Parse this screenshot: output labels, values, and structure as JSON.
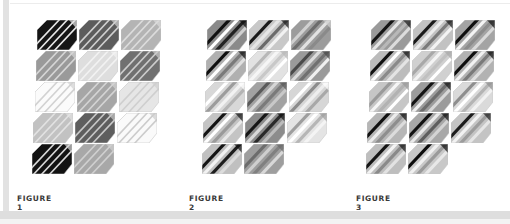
{
  "figures": [
    {
      "label": "FIGURE 1",
      "tiles": [
        {
          "bg": "#151515",
          "stripes": [
            "#e8e8e8",
            "#e8e8e8",
            "#e8e8e8",
            "#e8e8e8"
          ]
        },
        {
          "bg": "#5c5c5c",
          "stripes": [
            "#d0d0d0",
            "#d0d0d0",
            "#d0d0d0",
            "#d0d0d0"
          ]
        },
        {
          "bg": "#b4b4b4",
          "stripes": [
            "#dcdcdc",
            "#dcdcdc",
            "#dcdcdc",
            "#dcdcdc"
          ]
        },
        {
          "bg": "#9a9a9a",
          "stripes": [
            "#d6d6d6",
            "#d6d6d6",
            "#d6d6d6",
            "#d6d6d6"
          ]
        },
        {
          "bg": "#dedede",
          "stripes": [
            "#f2f2f2",
            "#f2f2f2",
            "#f2f2f2",
            "#f2f2f2"
          ]
        },
        {
          "bg": "#707070",
          "stripes": [
            "#cccccc",
            "#cccccc",
            "#cccccc",
            "#cccccc"
          ]
        },
        {
          "bg": "#fbfbfb",
          "stripes": [
            "#d2d2d2",
            "#d2d2d2",
            "#d2d2d2",
            "#d2d2d2"
          ]
        },
        {
          "bg": "#a6a6a6",
          "stripes": [
            "#d4d4d4",
            "#d4d4d4",
            "#d4d4d4",
            "#d4d4d4"
          ]
        },
        {
          "bg": "#e6e6e6",
          "stripes": [
            "#cfcfcf",
            "#cfcfcf",
            "#cfcfcf",
            "#cfcfcf"
          ]
        },
        {
          "bg": "#c2c2c2",
          "stripes": [
            "#e2e2e2",
            "#e2e2e2",
            "#e2e2e2",
            "#e2e2e2"
          ]
        },
        {
          "bg": "#5e5e5e",
          "stripes": [
            "#c8c8c8",
            "#c8c8c8",
            "#c8c8c8",
            "#c8c8c8"
          ]
        },
        {
          "bg": "#fafafa",
          "stripes": [
            "#cccccc",
            "#cccccc",
            "#cccccc",
            "#cccccc"
          ]
        },
        {
          "bg": "#121212",
          "stripes": [
            "#d8d8d8",
            "#d8d8d8",
            "#d8d8d8",
            "#d8d8d8"
          ]
        },
        {
          "bg": "#a8a8a8",
          "stripes": [
            "#d0d0d0",
            "#d0d0d0",
            "#d0d0d0",
            "#d0d0d0"
          ]
        }
      ]
    },
    {
      "label": "FIGURE 2",
      "tiles": [
        {
          "bg": "#8a8a8a",
          "stripes": [
            "#111111",
            "#ffffff",
            "#222222",
            "#d0d0d0"
          ]
        },
        {
          "bg": "#c8c8c8",
          "stripes": [
            "#1a1a1a",
            "#e6e6e6",
            "#6a6a6a",
            "#f2f2f2"
          ]
        },
        {
          "bg": "#9c9c9c",
          "stripes": [
            "#d0d0d0",
            "#6c6c6c",
            "#e2e2e2",
            "#8a8a8a"
          ]
        },
        {
          "bg": "#b0b0b0",
          "stripes": [
            "#0f0f0f",
            "#ffffff",
            "#7a7a7a",
            "#e0e0e0"
          ]
        },
        {
          "bg": "#e2e2e2",
          "stripes": [
            "#b8b8b8",
            "#f6f6f6",
            "#c8c8c8",
            "#ffffff"
          ]
        },
        {
          "bg": "#9a9a9a",
          "stripes": [
            "#4a4a4a",
            "#dcdcdc",
            "#707070",
            "#f0f0f0"
          ]
        },
        {
          "bg": "#d8d8d8",
          "stripes": [
            "#ffffff",
            "#9c9c9c",
            "#f2f2f2",
            "#b4b4b4"
          ]
        },
        {
          "bg": "#a2a2a2",
          "stripes": [
            "#5a5a5a",
            "#d6d6d6",
            "#7a7a7a",
            "#c8c8c8"
          ]
        },
        {
          "bg": "#d6d6d6",
          "stripes": [
            "#ffffff",
            "#8c8c8c",
            "#eeeeee",
            "#a8a8a8"
          ]
        },
        {
          "bg": "#c4c4c4",
          "stripes": [
            "#141414",
            "#ffffff",
            "#9a9a9a",
            "#e8e8e8"
          ]
        },
        {
          "bg": "#8c8c8c",
          "stripes": [
            "#161616",
            "#d8d8d8",
            "#2a2a2a",
            "#bcbcbc"
          ]
        },
        {
          "bg": "#e4e4e4",
          "stripes": [
            "#9e9e9e",
            "#ffffff",
            "#b6b6b6",
            "#f4f4f4"
          ]
        },
        {
          "bg": "#c0c0c0",
          "stripes": [
            "#141414",
            "#f2f2f2",
            "#1e1e1e",
            "#dcdcdc"
          ]
        },
        {
          "bg": "#9e9e9e",
          "stripes": [
            "#6c6c6c",
            "#cfcfcf",
            "#808080",
            "#d8d8d8"
          ]
        }
      ]
    },
    {
      "label": "FIGURE 3",
      "tiles": [
        {
          "bg": "#9a9a9a",
          "stripes": [
            "#151515",
            "#e6e6e6",
            "#b8b8b8",
            "#dcdcdc"
          ]
        },
        {
          "bg": "#c2c2c2",
          "stripes": [
            "#1a1a1a",
            "#ececec",
            "#7a7a7a",
            "#f4f4f4"
          ]
        },
        {
          "bg": "#a4a4a4",
          "stripes": [
            "#101010",
            "#f4f4f4",
            "#8c8c8c",
            "#dadada"
          ]
        },
        {
          "bg": "#bcbcbc",
          "stripes": [
            "#111111",
            "#ffffff",
            "#8a8a8a",
            "#e4e4e4"
          ]
        },
        {
          "bg": "#d0d0d0",
          "stripes": [
            "#a8a8a8",
            "#f4f4f4",
            "#c0c0c0",
            "#ffffff"
          ]
        },
        {
          "bg": "#b2b2b2",
          "stripes": [
            "#0e0e0e",
            "#f2f2f2",
            "#7a7a7a",
            "#e0e0e0"
          ]
        },
        {
          "bg": "#c6c6c6",
          "stripes": [
            "#9a9a9a",
            "#f6f6f6",
            "#b2b2b2",
            "#ffffff"
          ]
        },
        {
          "bg": "#9c9c9c",
          "stripes": [
            "#141414",
            "#f0f0f0",
            "#6e6e6e",
            "#d8d8d8"
          ]
        },
        {
          "bg": "#dadada",
          "stripes": [
            "#8e8e8e",
            "#ffffff",
            "#b4b4b4",
            "#f2f2f2"
          ]
        },
        {
          "bg": "#b6b6b6",
          "stripes": [
            "#101010",
            "#ececec",
            "#8e8e8e",
            "#dcdcdc"
          ]
        },
        {
          "bg": "#a8a8a8",
          "stripes": [
            "#121212",
            "#eaeaea",
            "#5e5e5e",
            "#d4d4d4"
          ]
        },
        {
          "bg": "#c4c4c4",
          "stripes": [
            "#1c1c1c",
            "#f2f2f2",
            "#9c9c9c",
            "#e6e6e6"
          ]
        },
        {
          "bg": "#bebebe",
          "stripes": [
            "#151515",
            "#f4f4f4",
            "#8a8a8a",
            "#e2e2e2"
          ]
        },
        {
          "bg": "#c8c8c8",
          "stripes": [
            "#0c0c0c",
            "#f0f0f0",
            "#9a9a9a",
            "#e8e8e8"
          ]
        }
      ]
    }
  ],
  "layout": {
    "figure_origins": [
      [
        37,
        20
      ],
      [
        207,
        20
      ],
      [
        371,
        20
      ]
    ],
    "caption_x": [
      17,
      189,
      356
    ],
    "col_step": 42,
    "row_step": 31,
    "row_skew": -1.2
  }
}
